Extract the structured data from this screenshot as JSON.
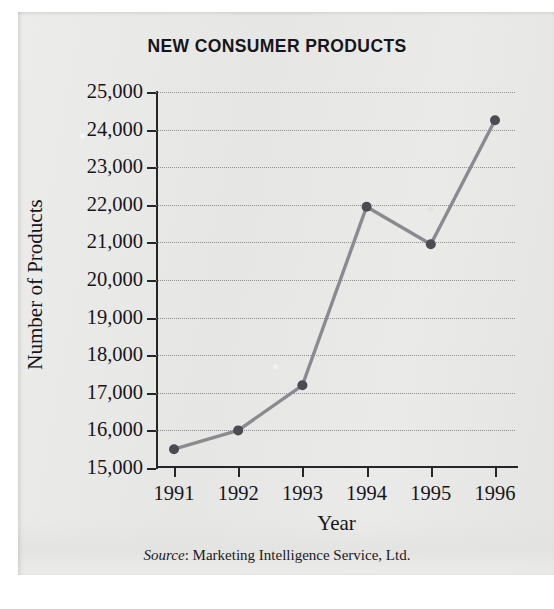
{
  "figure": {
    "title": "NEW CONSUMER PRODUCTS",
    "x_axis_label": "Year",
    "y_axis_label": "Number of Products",
    "source_word": "Source",
    "source_text": ": Marketing Intelligence Service, Ltd."
  },
  "style": {
    "line_color": "#8a8a90",
    "marker_color": "#4b4b52",
    "axis_color": "#26262a",
    "grid_color": "#8f8f93",
    "paper_color": "#e8e8e6",
    "text_color": "#16161a"
  },
  "chart_data": {
    "type": "line",
    "title": "NEW CONSUMER PRODUCTS",
    "xlabel": "Year",
    "ylabel": "Number of Products",
    "categories": [
      "1991",
      "1992",
      "1993",
      "1994",
      "1995",
      "1996"
    ],
    "x": [
      1991,
      1992,
      1993,
      1994,
      1995,
      1996
    ],
    "values": [
      15500,
      16000,
      17200,
      21950,
      20950,
      24250
    ],
    "ylim": [
      15000,
      25000
    ],
    "ytick_values": [
      25000,
      24000,
      23000,
      22000,
      21000,
      20000,
      19000,
      18000,
      17000,
      16000,
      15000
    ],
    "ytick_labels": [
      "25,000",
      "24,000",
      "23,000",
      "22,000",
      "21,000",
      "20,000",
      "19,000",
      "18,000",
      "17,000",
      "16,000",
      "15,000"
    ],
    "xtick_labels": [
      "1991",
      "1992",
      "1993",
      "1994",
      "1995",
      "1996"
    ],
    "grid": true,
    "grid_axis": "y",
    "legend": false,
    "markers": true,
    "source": "Source: Marketing Intelligence Service, Ltd."
  }
}
